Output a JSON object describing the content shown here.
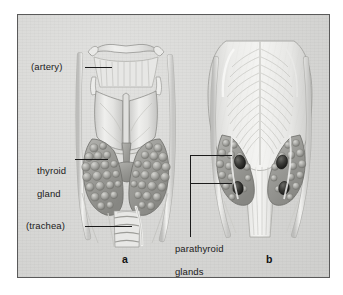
{
  "figure": {
    "domain_title": "Thyroid and parathyroid glands",
    "background_color": "#d9d9d7",
    "frame_color": "#5a5a5a",
    "ink_color": "#1b1b1b"
  },
  "labels": {
    "artery": "(artery)",
    "thyroid_line1": "thyroid",
    "thyroid_line2": "gland",
    "trachea": "(trachea)",
    "parathyroid_line1": "parathyroid",
    "parathyroid_line2": "glands"
  },
  "panels": {
    "a": "a",
    "b": "b"
  },
  "illustration": {
    "panel_a_view": "anterior view of larynx, thyroid gland and trachea",
    "panel_b_view": "posterior view of pharynx, thyroid lobes and four parathyroid glands",
    "parathyroid_count": 4
  }
}
